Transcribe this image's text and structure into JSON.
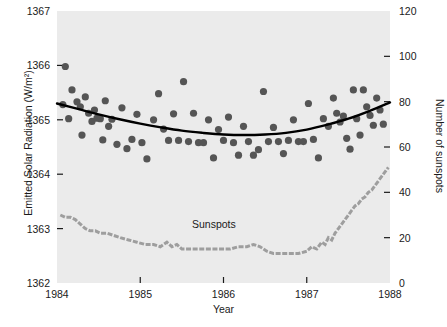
{
  "chart_data": {
    "type": "scatter",
    "title": "",
    "xlabel": "Year",
    "ylabel": "Emitted Solar Radiation (W/m²)",
    "ylabel_right": "Number of sunspots",
    "xlim": [
      1984,
      1988
    ],
    "ylim": [
      1362,
      1367
    ],
    "ylim_right": [
      0,
      120
    ],
    "xticks": [
      1984,
      1985,
      1986,
      1987,
      1988
    ],
    "xtick_labels": [
      "1984",
      "1985",
      "1986",
      "1987",
      "1988"
    ],
    "yticks": [
      1362,
      1363,
      1364,
      1365,
      1366,
      1367
    ],
    "ytick_labels": [
      "1362",
      "1363",
      "1364",
      "1365",
      "1366",
      "1367"
    ],
    "yticks_right": [
      0,
      20,
      40,
      60,
      80,
      100,
      120
    ],
    "ytick_labels_right": [
      "0",
      "20",
      "40",
      "60",
      "80",
      "100",
      "120"
    ],
    "grid": false,
    "legend_position": "inline-annotation",
    "plot_background": "#ebebeb",
    "annotations": [
      {
        "text": "Sunspots",
        "x": 1986.0,
        "y_right": 27
      }
    ],
    "series": [
      {
        "name": "Emitted Solar Radiation",
        "type": "scatter",
        "axis": "left",
        "marker": "circle",
        "color": "#555555",
        "points": [
          {
            "x": 1984.07,
            "y": 1365.28
          },
          {
            "x": 1984.1,
            "y": 1365.98
          },
          {
            "x": 1984.14,
            "y": 1365.02
          },
          {
            "x": 1984.18,
            "y": 1365.55
          },
          {
            "x": 1984.24,
            "y": 1365.33
          },
          {
            "x": 1984.28,
            "y": 1365.24
          },
          {
            "x": 1984.3,
            "y": 1364.72
          },
          {
            "x": 1984.34,
            "y": 1365.42
          },
          {
            "x": 1984.38,
            "y": 1365.12
          },
          {
            "x": 1984.42,
            "y": 1364.97
          },
          {
            "x": 1984.45,
            "y": 1365.18
          },
          {
            "x": 1984.48,
            "y": 1365.03
          },
          {
            "x": 1984.52,
            "y": 1365.02
          },
          {
            "x": 1984.55,
            "y": 1364.63
          },
          {
            "x": 1984.58,
            "y": 1365.35
          },
          {
            "x": 1984.62,
            "y": 1364.88
          },
          {
            "x": 1984.66,
            "y": 1365.01
          },
          {
            "x": 1984.72,
            "y": 1364.55
          },
          {
            "x": 1984.78,
            "y": 1365.22
          },
          {
            "x": 1984.84,
            "y": 1364.47
          },
          {
            "x": 1984.9,
            "y": 1364.64
          },
          {
            "x": 1984.96,
            "y": 1365.1
          },
          {
            "x": 1985.02,
            "y": 1364.58
          },
          {
            "x": 1985.08,
            "y": 1364.28
          },
          {
            "x": 1985.16,
            "y": 1365.0
          },
          {
            "x": 1985.22,
            "y": 1365.48
          },
          {
            "x": 1985.28,
            "y": 1364.83
          },
          {
            "x": 1985.34,
            "y": 1364.62
          },
          {
            "x": 1985.4,
            "y": 1365.11
          },
          {
            "x": 1985.46,
            "y": 1364.62
          },
          {
            "x": 1985.52,
            "y": 1365.7
          },
          {
            "x": 1985.58,
            "y": 1364.6
          },
          {
            "x": 1985.64,
            "y": 1365.12
          },
          {
            "x": 1985.7,
            "y": 1364.58
          },
          {
            "x": 1985.76,
            "y": 1364.58
          },
          {
            "x": 1985.82,
            "y": 1365.0
          },
          {
            "x": 1985.88,
            "y": 1364.3
          },
          {
            "x": 1985.94,
            "y": 1364.82
          },
          {
            "x": 1986.0,
            "y": 1364.62
          },
          {
            "x": 1986.06,
            "y": 1365.05
          },
          {
            "x": 1986.12,
            "y": 1364.58
          },
          {
            "x": 1986.18,
            "y": 1364.35
          },
          {
            "x": 1986.24,
            "y": 1364.88
          },
          {
            "x": 1986.3,
            "y": 1364.6
          },
          {
            "x": 1986.36,
            "y": 1364.35
          },
          {
            "x": 1986.42,
            "y": 1364.45
          },
          {
            "x": 1986.48,
            "y": 1365.52
          },
          {
            "x": 1986.54,
            "y": 1364.6
          },
          {
            "x": 1986.6,
            "y": 1364.86
          },
          {
            "x": 1986.66,
            "y": 1364.6
          },
          {
            "x": 1986.72,
            "y": 1364.38
          },
          {
            "x": 1986.78,
            "y": 1364.62
          },
          {
            "x": 1986.84,
            "y": 1365.0
          },
          {
            "x": 1986.9,
            "y": 1364.6
          },
          {
            "x": 1986.96,
            "y": 1364.6
          },
          {
            "x": 1987.02,
            "y": 1365.3
          },
          {
            "x": 1987.08,
            "y": 1364.64
          },
          {
            "x": 1987.14,
            "y": 1364.3
          },
          {
            "x": 1987.2,
            "y": 1365.02
          },
          {
            "x": 1987.26,
            "y": 1364.88
          },
          {
            "x": 1987.32,
            "y": 1365.4
          },
          {
            "x": 1987.36,
            "y": 1365.12
          },
          {
            "x": 1987.4,
            "y": 1364.96
          },
          {
            "x": 1987.44,
            "y": 1365.07
          },
          {
            "x": 1987.48,
            "y": 1364.66
          },
          {
            "x": 1987.52,
            "y": 1364.46
          },
          {
            "x": 1987.56,
            "y": 1365.55
          },
          {
            "x": 1987.6,
            "y": 1365.02
          },
          {
            "x": 1987.64,
            "y": 1364.72
          },
          {
            "x": 1987.68,
            "y": 1365.55
          },
          {
            "x": 1987.72,
            "y": 1365.24
          },
          {
            "x": 1987.76,
            "y": 1365.08
          },
          {
            "x": 1987.8,
            "y": 1364.9
          },
          {
            "x": 1987.84,
            "y": 1365.4
          },
          {
            "x": 1987.88,
            "y": 1365.18
          },
          {
            "x": 1987.92,
            "y": 1364.92
          }
        ]
      },
      {
        "name": "Fitted quadratic trend",
        "type": "line",
        "axis": "left",
        "color": "#000000",
        "points": [
          {
            "x": 1984.0,
            "y": 1365.3
          },
          {
            "x": 1984.25,
            "y": 1365.2
          },
          {
            "x": 1984.5,
            "y": 1365.1
          },
          {
            "x": 1984.75,
            "y": 1365.01
          },
          {
            "x": 1985.0,
            "y": 1364.93
          },
          {
            "x": 1985.25,
            "y": 1364.86
          },
          {
            "x": 1985.5,
            "y": 1364.8
          },
          {
            "x": 1985.75,
            "y": 1364.76
          },
          {
            "x": 1986.0,
            "y": 1364.73
          },
          {
            "x": 1986.25,
            "y": 1364.72
          },
          {
            "x": 1986.5,
            "y": 1364.73
          },
          {
            "x": 1986.75,
            "y": 1364.76
          },
          {
            "x": 1987.0,
            "y": 1364.82
          },
          {
            "x": 1987.25,
            "y": 1364.91
          },
          {
            "x": 1987.5,
            "y": 1365.02
          },
          {
            "x": 1987.75,
            "y": 1365.16
          },
          {
            "x": 1988.0,
            "y": 1365.32
          }
        ]
      },
      {
        "name": "Sunspots",
        "type": "line",
        "axis": "right",
        "color": "#9e9e9e",
        "points": [
          {
            "x": 1984.04,
            "y": 30
          },
          {
            "x": 1984.1,
            "y": 29
          },
          {
            "x": 1984.16,
            "y": 29
          },
          {
            "x": 1984.22,
            "y": 28
          },
          {
            "x": 1984.28,
            "y": 26
          },
          {
            "x": 1984.34,
            "y": 24
          },
          {
            "x": 1984.4,
            "y": 23
          },
          {
            "x": 1984.46,
            "y": 23
          },
          {
            "x": 1984.52,
            "y": 22
          },
          {
            "x": 1984.6,
            "y": 22
          },
          {
            "x": 1984.68,
            "y": 21
          },
          {
            "x": 1984.76,
            "y": 20
          },
          {
            "x": 1984.86,
            "y": 19
          },
          {
            "x": 1984.96,
            "y": 18
          },
          {
            "x": 1985.06,
            "y": 17
          },
          {
            "x": 1985.16,
            "y": 17
          },
          {
            "x": 1985.24,
            "y": 16
          },
          {
            "x": 1985.32,
            "y": 18
          },
          {
            "x": 1985.38,
            "y": 16
          },
          {
            "x": 1985.44,
            "y": 17
          },
          {
            "x": 1985.5,
            "y": 15
          },
          {
            "x": 1985.6,
            "y": 15
          },
          {
            "x": 1985.72,
            "y": 15
          },
          {
            "x": 1985.84,
            "y": 15
          },
          {
            "x": 1985.96,
            "y": 15
          },
          {
            "x": 1986.08,
            "y": 15
          },
          {
            "x": 1986.18,
            "y": 16
          },
          {
            "x": 1986.28,
            "y": 16
          },
          {
            "x": 1986.36,
            "y": 17
          },
          {
            "x": 1986.44,
            "y": 16
          },
          {
            "x": 1986.52,
            "y": 14
          },
          {
            "x": 1986.6,
            "y": 13
          },
          {
            "x": 1986.7,
            "y": 13
          },
          {
            "x": 1986.8,
            "y": 13
          },
          {
            "x": 1986.9,
            "y": 13
          },
          {
            "x": 1987.0,
            "y": 14
          },
          {
            "x": 1987.06,
            "y": 16
          },
          {
            "x": 1987.12,
            "y": 15
          },
          {
            "x": 1987.18,
            "y": 18
          },
          {
            "x": 1987.22,
            "y": 17
          },
          {
            "x": 1987.26,
            "y": 20
          },
          {
            "x": 1987.3,
            "y": 19
          },
          {
            "x": 1987.34,
            "y": 22
          },
          {
            "x": 1987.38,
            "y": 24
          },
          {
            "x": 1987.42,
            "y": 26
          },
          {
            "x": 1987.46,
            "y": 28
          },
          {
            "x": 1987.5,
            "y": 30
          },
          {
            "x": 1987.54,
            "y": 32
          },
          {
            "x": 1987.58,
            "y": 34
          },
          {
            "x": 1987.62,
            "y": 35
          },
          {
            "x": 1987.66,
            "y": 37
          },
          {
            "x": 1987.7,
            "y": 38
          },
          {
            "x": 1987.74,
            "y": 40
          },
          {
            "x": 1987.78,
            "y": 41
          },
          {
            "x": 1987.82,
            "y": 43
          },
          {
            "x": 1987.86,
            "y": 45
          },
          {
            "x": 1987.9,
            "y": 47
          },
          {
            "x": 1987.94,
            "y": 49
          },
          {
            "x": 1987.98,
            "y": 51
          }
        ]
      }
    ]
  }
}
